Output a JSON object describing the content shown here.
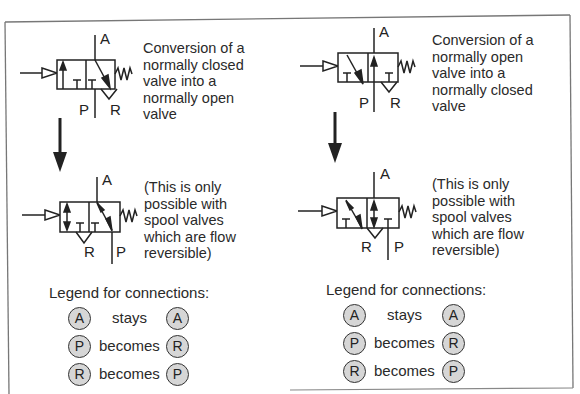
{
  "left_panel": {
    "top_description": "Conversion of a\nnormally closed\nvalve into a\nnormally open\nvalve",
    "bottom_note": "(This is only\npossible with\nspool valves\nwhich are flow\nreversible)",
    "top_valve_ports": {
      "top": "A",
      "bottom_left": "P",
      "bottom_right": "R"
    },
    "bottom_valve_ports": {
      "top": "A",
      "bottom_left": "R",
      "bottom_right": "P"
    },
    "legend": {
      "title": "Legend for connections:",
      "rows": [
        {
          "from": "A",
          "verb": "stays",
          "to": "A"
        },
        {
          "from": "P",
          "verb": "becomes",
          "to": "R"
        },
        {
          "from": "R",
          "verb": "becomes",
          "to": "P"
        }
      ]
    }
  },
  "right_panel": {
    "top_description": "Conversion of a\nnormally open\nvalve into a\nnormally closed\nvalve",
    "bottom_note": "(This is only\npossible with\nspool valves\nwhich are flow\nreversible)",
    "top_valve_ports": {
      "top": "A",
      "bottom_left": "P",
      "bottom_right": "R"
    },
    "bottom_valve_ports": {
      "top": "A",
      "bottom_left": "R",
      "bottom_right": "P"
    },
    "legend": {
      "title": "Legend for connections:",
      "rows": [
        {
          "from": "A",
          "verb": "stays",
          "to": "A"
        },
        {
          "from": "P",
          "verb": "becomes",
          "to": "R"
        },
        {
          "from": "R",
          "verb": "becomes",
          "to": "P"
        }
      ]
    }
  },
  "colors": {
    "line": "#222222",
    "frame": "#777777",
    "circle_fill": "#d6d6d6"
  }
}
